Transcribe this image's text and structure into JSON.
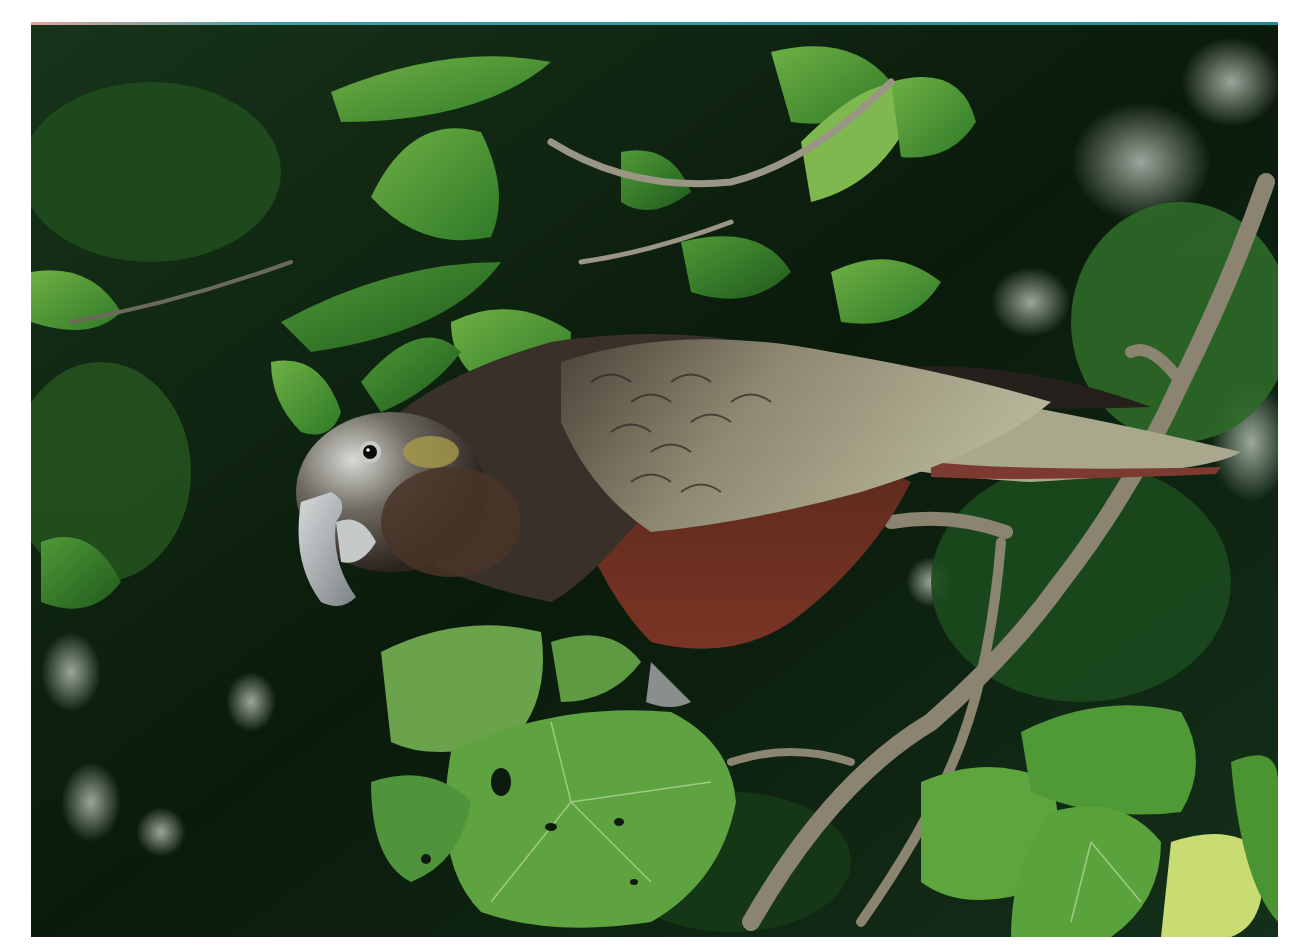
{
  "image": {
    "subject": "Kākā parrot perched on a branch among green foliage",
    "alt": "A brown and olive-grey parrot with a pale grey crown and large hooked grey beak perches on a thin branch surrounded by glossy green leaves and large heart-shaped leaves with holes",
    "frame": {
      "left": 31,
      "top": 22,
      "width": 1247,
      "height": 915
    },
    "palette": {
      "background": "#ffffff",
      "foliage_dark": "#0b1a0c",
      "foliage_mid": "#2f6b24",
      "leaf_light": "#5ea43a",
      "leaf_pale": "#7fb556",
      "bird_crown": "#c9ccc8",
      "bird_body": "#3a302a",
      "bird_belly": "#6a2c1c",
      "bird_wing": "#8d8a70",
      "beak": "#a9aeb0",
      "branch": "#8a8470"
    }
  }
}
